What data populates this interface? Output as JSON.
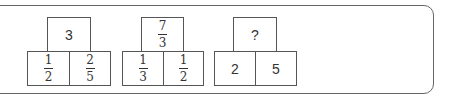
{
  "diagrams": [
    {
      "top": {
        "type": "integer",
        "value": "3"
      },
      "bottom_left": {
        "type": "fraction",
        "num": "1",
        "den": "2"
      },
      "bottom_right": {
        "type": "fraction",
        "num": "2",
        "den": "5"
      }
    },
    {
      "top": {
        "type": "fraction",
        "num": "7",
        "den": "3"
      },
      "bottom_left": {
        "type": "fraction",
        "num": "1",
        "den": "3"
      },
      "bottom_right": {
        "type": "fraction",
        "num": "1",
        "den": "2"
      }
    },
    {
      "top": {
        "type": "text",
        "value": "?"
      },
      "bottom_left": {
        "type": "integer",
        "value": "2"
      },
      "bottom_right": {
        "type": "integer",
        "value": "5"
      }
    }
  ]
}
